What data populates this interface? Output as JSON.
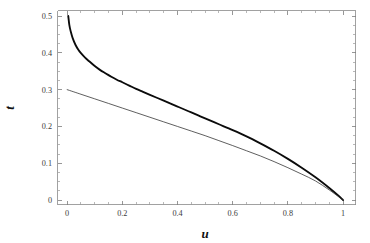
{
  "figure": {
    "background_color": "#ffffff",
    "frame_color": "#8a8a8a",
    "width": 370,
    "height": 243
  },
  "chart_data": {
    "type": "line",
    "title": "",
    "subtitle": "",
    "xlabel": "u",
    "ylabel": "t",
    "xlim": [
      -0.035,
      1.045
    ],
    "ylim": [
      -0.012,
      0.515
    ],
    "grid": false,
    "legend": null,
    "frame": true,
    "xticks": [
      0,
      0.2,
      0.4,
      0.6,
      0.8,
      1
    ],
    "xticklabels": [
      "0",
      "0.2",
      "0.4",
      "0.6",
      "0.8",
      "1"
    ],
    "yticks": [
      0,
      0.1,
      0.2,
      0.3,
      0.4,
      0.5
    ],
    "yticklabels": [
      "0",
      "0.1",
      "0.2",
      "0.3",
      "0.4",
      "0.5"
    ],
    "x_minor_step": 0.05,
    "y_minor_step": 0.025,
    "series": [
      {
        "name": "thick-curve",
        "style": "solid",
        "color": "#0b0b0b",
        "linewidth": 1.85,
        "x": [
          0.004,
          0.008,
          0.013,
          0.02,
          0.03,
          0.04,
          0.05,
          0.065,
          0.08,
          0.1,
          0.12,
          0.14,
          0.16,
          0.18,
          0.2,
          0.225,
          0.25,
          0.275,
          0.3,
          0.325,
          0.35,
          0.375,
          0.4,
          0.425,
          0.45,
          0.475,
          0.5,
          0.55,
          0.6,
          0.65,
          0.7,
          0.75,
          0.8,
          0.85,
          0.9,
          0.95,
          0.98,
          1.0
        ],
        "y": [
          0.5,
          0.475,
          0.458,
          0.44,
          0.422,
          0.409,
          0.399,
          0.387,
          0.377,
          0.364,
          0.353,
          0.344,
          0.335,
          0.327,
          0.32,
          0.311,
          0.302,
          0.294,
          0.286,
          0.278,
          0.27,
          0.262,
          0.254,
          0.246,
          0.238,
          0.23,
          0.222,
          0.206,
          0.19,
          0.173,
          0.154,
          0.134,
          0.112,
          0.088,
          0.062,
          0.033,
          0.014,
          0.0
        ]
      },
      {
        "name": "thin-curve",
        "style": "solid",
        "color": "#2a2a2a",
        "linewidth": 0.75,
        "x": [
          0.0,
          0.05,
          0.1,
          0.15,
          0.2,
          0.25,
          0.3,
          0.35,
          0.4,
          0.45,
          0.5,
          0.55,
          0.6,
          0.65,
          0.7,
          0.75,
          0.8,
          0.85,
          0.9,
          0.95,
          1.0
        ],
        "y": [
          0.3,
          0.2875,
          0.275,
          0.2625,
          0.25,
          0.2375,
          0.225,
          0.2125,
          0.2,
          0.1875,
          0.175,
          0.1615,
          0.148,
          0.134,
          0.12,
          0.1045,
          0.088,
          0.0705,
          0.052,
          0.0275,
          0.0
        ]
      }
    ],
    "annotations": []
  }
}
